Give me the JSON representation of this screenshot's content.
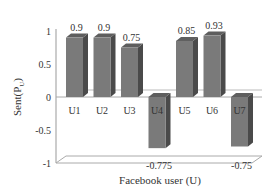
{
  "chart_data": {
    "type": "bar",
    "title": "",
    "xlabel": "Facebook user (U)",
    "ylabel": "Sent(P_U)",
    "ylabel_main": "Sent(P",
    "ylabel_sub": "U",
    "ylabel_close": ")",
    "categories": [
      "U1",
      "U2",
      "U3",
      "U4",
      "U5",
      "U6",
      "U7"
    ],
    "values": [
      0.9,
      0.9,
      0.75,
      -0.775,
      0.85,
      0.93,
      -0.75
    ],
    "value_labels": [
      "0.9",
      "0.9",
      "0.75",
      "-0.775",
      "0.85",
      "0.93",
      "-0.75"
    ],
    "ylim": [
      -1,
      1
    ],
    "yticks": [
      1,
      0.5,
      0,
      -0.5,
      -1
    ],
    "ytick_labels": [
      "1",
      "0.5",
      "0",
      "-0.5",
      "-1"
    ],
    "grid": false,
    "legend": null,
    "style": "3d-column",
    "bar_color": "#7a7a7a",
    "bar_side_color": "#4a4a4a",
    "bar_top_color": "#5e5e5e"
  }
}
